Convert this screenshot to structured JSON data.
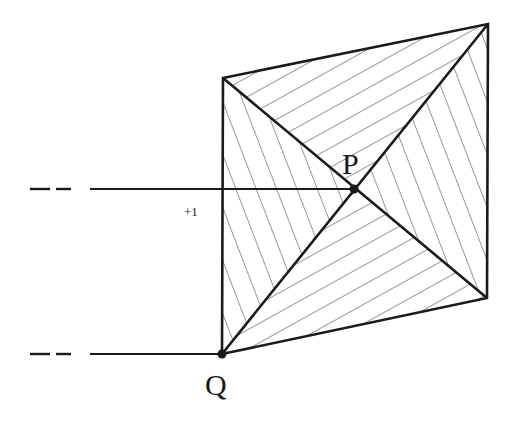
{
  "diagram": {
    "title": "",
    "stroke_color": "#1a1a1a",
    "hatch_color": "#333333",
    "vertices": {
      "A": [
        223,
        78
      ],
      "B": [
        488,
        24
      ],
      "C": [
        487,
        298
      ],
      "Q": [
        222,
        354
      ],
      "P": [
        354,
        189
      ]
    },
    "labels": {
      "P": "P",
      "Q": "Q",
      "plus_one": "+1"
    },
    "leader_lines": [
      {
        "from": "P",
        "y": 189,
        "dash_segments": [
          [
            30,
            50
          ],
          [
            60,
            80
          ]
        ],
        "solid_from_x": 90
      },
      {
        "from": "Q",
        "y": 354,
        "dash_segments": [
          [
            30,
            50
          ],
          [
            60,
            80
          ]
        ],
        "solid_from_x": 90
      }
    ],
    "regions": [
      {
        "name": "top-triangle",
        "points": [
          "A",
          "B",
          "P"
        ],
        "hatch": "shallow"
      },
      {
        "name": "left-triangle",
        "points": [
          "A",
          "P",
          "Q"
        ],
        "hatch": "steep"
      },
      {
        "name": "right-triangle",
        "points": [
          "B",
          "C",
          "P"
        ],
        "hatch": "steep"
      },
      {
        "name": "bottom-triangle",
        "points": [
          "Q",
          "P",
          "C"
        ],
        "hatch": "shallow"
      }
    ]
  }
}
